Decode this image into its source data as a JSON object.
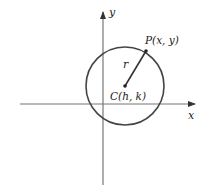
{
  "diagram": {
    "type": "circle-on-cartesian-plane",
    "axes": {
      "x_label": "x",
      "y_label": "y"
    },
    "circle": {
      "center_label": "C(h, k)",
      "point_label": "P(x, y)",
      "radius_label": "r"
    },
    "colors": {
      "axis": "#777777",
      "circle": "#444444",
      "text": "#222222"
    }
  }
}
